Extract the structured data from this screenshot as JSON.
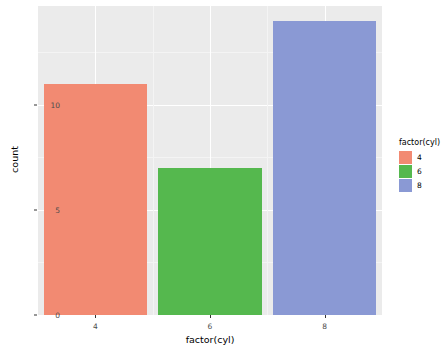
{
  "chart_data": {
    "type": "bar",
    "title": "",
    "subtitle": "",
    "xlabel": "factor(cyl)",
    "ylabel": "count",
    "categories": [
      "4",
      "6",
      "8"
    ],
    "values": [
      11,
      7,
      14
    ],
    "series": [
      {
        "name": "count",
        "values": [
          11,
          7,
          14
        ]
      }
    ],
    "xtick_labels": [
      "4",
      "6",
      "8"
    ],
    "ytick_labels": [
      "0",
      "5",
      "10"
    ],
    "ytick_values": [
      0,
      5,
      10
    ],
    "ylim": [
      0,
      14.7
    ],
    "grid": "major and minor white gridlines on gray panel",
    "legend": {
      "title": "factor(cyl)",
      "position": "right",
      "entries": [
        {
          "label": "4",
          "color": "#f28a72"
        },
        {
          "label": "6",
          "color": "#55b84e"
        },
        {
          "label": "8",
          "color": "#8a99d4"
        }
      ]
    },
    "colors": {
      "bar_4": "#f28a72",
      "bar_6": "#55b84e",
      "bar_8": "#8a99d4",
      "panel_background": "#ebebeb",
      "grid_major": "#ffffff",
      "grid_minor": "#f4f4f4",
      "plot_background": "#ffffff",
      "text": "#000000",
      "axis_text": "#4d4d4d"
    }
  }
}
